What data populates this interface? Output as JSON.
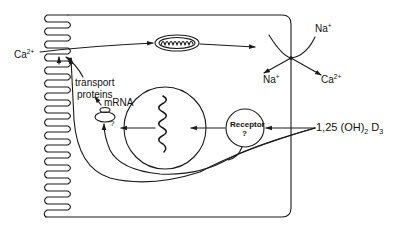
{
  "diagram": {
    "type": "cell-schematic",
    "colors": {
      "stroke": "#1a1a1a",
      "background": "#ffffff"
    },
    "labels": {
      "ca_in": {
        "base": "Ca",
        "sup": "2+"
      },
      "transport_proteins_line1": "transport",
      "transport_proteins_line2": "proteins",
      "mrna": "mRNA",
      "receptor": "Receptor",
      "receptor_q": "?",
      "ribosome_q": "?",
      "na_top": {
        "base": "Na",
        "sup": "+"
      },
      "na_bottom": {
        "base": "Na",
        "sup": "+"
      },
      "ca_out": {
        "base": "Ca",
        "sup": "2+"
      },
      "hormone": {
        "prefix": "1,25 (OH)",
        "sub": "2",
        "mid": " D",
        "sub2": "3"
      }
    },
    "nodes": [
      {
        "id": "brush-border",
        "label": "microvilli"
      },
      {
        "id": "mitochondrion",
        "label": "mitochondrion"
      },
      {
        "id": "nucleus",
        "label": "nucleus with DNA"
      },
      {
        "id": "receptor",
        "label": "Receptor ?"
      },
      {
        "id": "ribosome",
        "label": "mRNA / ribosome"
      },
      {
        "id": "exchanger",
        "label": "Na+/Ca2+ exchanger"
      }
    ],
    "edges": [
      {
        "from": "Ca2+ (lumen)",
        "to": "mitochondrion"
      },
      {
        "from": "mitochondrion",
        "to": "exchanger"
      },
      {
        "from": "1,25(OH)2 D3",
        "to": "receptor"
      },
      {
        "from": "receptor",
        "to": "nucleus"
      },
      {
        "from": "nucleus",
        "to": "ribosome"
      },
      {
        "from": "ribosome",
        "to": "transport proteins"
      },
      {
        "from": "1,25(OH)2 D3",
        "to": "ribosome"
      },
      {
        "from": "1,25(OH)2 D3",
        "to": "brush-border"
      }
    ]
  }
}
